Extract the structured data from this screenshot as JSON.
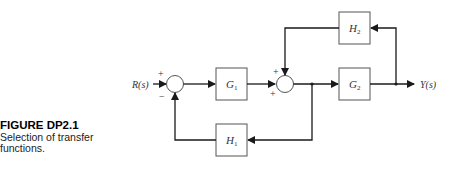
{
  "caption": {
    "title": "FIGURE DP2.1",
    "description": "Selection of transfer functions."
  },
  "diagram": {
    "input_label": "R(s)",
    "output_label": "Y(s)",
    "blocks": [
      {
        "id": "G1",
        "letter": "G",
        "sub": "1"
      },
      {
        "id": "G2",
        "letter": "G",
        "sub": "2"
      },
      {
        "id": "H1",
        "letter": "H",
        "sub": "1"
      },
      {
        "id": "H2",
        "letter": "H",
        "sub": "2"
      }
    ],
    "summing_junctions": [
      {
        "id": "sum1",
        "signs": {
          "left": "+",
          "bottom": "−"
        }
      },
      {
        "id": "sum2",
        "signs": {
          "top": "+",
          "left": "+"
        }
      }
    ],
    "colors": {
      "line": "#1a1a1a",
      "box": "#555555",
      "text": "#333333"
    }
  }
}
